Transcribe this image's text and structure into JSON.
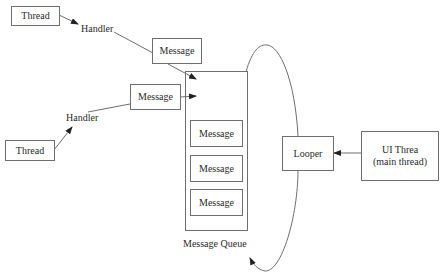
{
  "diagram": {
    "threads": [
      {
        "label": "Thread"
      },
      {
        "label": "Thread"
      }
    ],
    "handlers": [
      {
        "label": "Handler"
      },
      {
        "label": "Handler"
      }
    ],
    "incoming_messages": [
      {
        "label": "Message"
      },
      {
        "label": "Message"
      }
    ],
    "queue": {
      "label": "Message Queue",
      "messages": [
        {
          "label": "Message"
        },
        {
          "label": "Message"
        },
        {
          "label": "Message"
        }
      ]
    },
    "looper": {
      "label": "Looper"
    },
    "ui_thread": {
      "line1": "UI Threa",
      "line2": "(main thread)"
    },
    "colors": {
      "line": "#6e6e6e",
      "text": "#2a2a2a",
      "background": "#ffffff"
    }
  }
}
